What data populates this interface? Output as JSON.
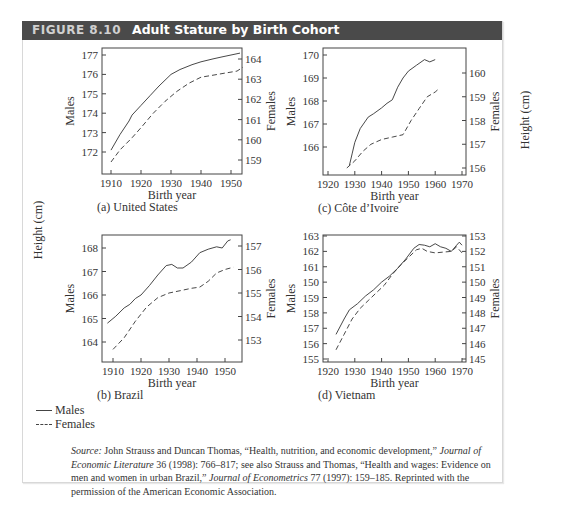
{
  "figure": {
    "number": "FIGURE 8.10",
    "title": "Adult Stature by Birth Cohort",
    "shared_ylabel": "Height (cm)"
  },
  "legend": {
    "items": [
      {
        "label": "Males",
        "style": "solid"
      },
      {
        "label": "Females",
        "style": "dashed"
      }
    ]
  },
  "source": {
    "label": "Source:",
    "text_1": " John Strauss and Duncan Thomas, “Health, nutrition, and economic development,” ",
    "journal_1": "Journal of Economic Literature",
    "text_2": " 36 (1998): 766–817; see also Strauss and Thomas, “Health and wages: Evidence on men and women in urban Brazil,” ",
    "journal_2": "Journal of Econometrics",
    "text_3": " 77 (1997): 159–185. Reprinted with the permission of the American Economic Association."
  },
  "chart_data": [
    {
      "type": "line",
      "panel": "(a) United States",
      "xlabel": "Birth year",
      "ylabel_left": "Males",
      "ylabel_right": "Females",
      "x_ticks": [
        1910,
        1920,
        1930,
        1940,
        1950
      ],
      "y_left_ticks": [
        172,
        173,
        174,
        175,
        176,
        177
      ],
      "y_right_ticks": [
        159,
        160,
        161,
        162,
        163,
        164
      ],
      "frame": {
        "x0": 102,
        "x1": 242,
        "y0": 48,
        "y1": 174
      },
      "xmap": {
        "v0": 1910,
        "p0": 111,
        "v1": 1950,
        "p1": 231
      },
      "ymap_left": {
        "v0": 172,
        "p0": 152,
        "v1": 177,
        "p1": 55
      },
      "ymap_right": {
        "v0": 159,
        "p0": 160,
        "v1": 164,
        "p1": 59
      },
      "series": [
        {
          "name": "Males",
          "axis": "left",
          "style": "solid",
          "x": [
            1910,
            1913,
            1916,
            1917,
            1920,
            1923,
            1926,
            1930,
            1933,
            1937,
            1940,
            1944,
            1947,
            1950,
            1953
          ],
          "y": [
            172.1,
            172.9,
            173.6,
            173.9,
            174.4,
            174.9,
            175.4,
            176.0,
            176.25,
            176.5,
            176.65,
            176.8,
            176.9,
            177.0,
            177.1
          ]
        },
        {
          "name": "Females",
          "axis": "right",
          "style": "dashed",
          "x": [
            1910,
            1913,
            1917,
            1920,
            1924,
            1928,
            1932,
            1936,
            1940,
            1944,
            1948,
            1952,
            1954
          ],
          "y": [
            158.9,
            159.5,
            160.1,
            160.6,
            161.3,
            161.9,
            162.4,
            162.8,
            163.1,
            163.2,
            163.3,
            163.4,
            163.6
          ]
        }
      ]
    },
    {
      "type": "line",
      "panel": "(c) Côte d’Ivoire",
      "xlabel": "Birth year",
      "ylabel_left": "Males",
      "ylabel_right": "Females",
      "x_ticks": [
        1920,
        1930,
        1940,
        1950,
        1960,
        1970
      ],
      "y_left_ticks": [
        166,
        167,
        168,
        169,
        170
      ],
      "y_right_ticks": [
        156,
        157,
        158,
        159,
        160
      ],
      "frame": {
        "x0": 323,
        "x1": 466,
        "y0": 48,
        "y1": 175
      },
      "xmap": {
        "v0": 1920,
        "p0": 328,
        "v1": 1970,
        "p1": 462
      },
      "ymap_left": {
        "v0": 166,
        "p0": 147,
        "v1": 170,
        "p1": 55
      },
      "ymap_right": {
        "v0": 156,
        "p0": 168,
        "v1": 160,
        "p1": 73
      },
      "series": [
        {
          "name": "Males",
          "axis": "left",
          "style": "solid",
          "x": [
            1928,
            1929,
            1930,
            1932,
            1935,
            1937,
            1940,
            1942,
            1944,
            1946,
            1948,
            1950,
            1953,
            1956,
            1958,
            1960
          ],
          "y": [
            165.2,
            165.7,
            166.2,
            166.8,
            167.3,
            167.45,
            167.7,
            167.9,
            168.05,
            168.6,
            169.0,
            169.3,
            169.55,
            169.8,
            169.7,
            169.8
          ]
        },
        {
          "name": "Females",
          "axis": "right",
          "style": "dashed",
          "x": [
            1927,
            1930,
            1933,
            1936,
            1940,
            1944,
            1948,
            1951,
            1954,
            1957,
            1960,
            1961
          ],
          "y": [
            156.0,
            156.3,
            156.7,
            157.0,
            157.2,
            157.3,
            157.4,
            158.0,
            158.5,
            159.0,
            159.2,
            159.3
          ]
        }
      ]
    },
    {
      "type": "line",
      "panel": "(b) Brazil",
      "xlabel": "Birth year",
      "ylabel_left": "Males",
      "ylabel_right": "Females",
      "x_ticks": [
        1910,
        1920,
        1930,
        1940,
        1950
      ],
      "y_left_ticks": [
        164,
        165,
        166,
        167,
        168
      ],
      "y_right_ticks": [
        153,
        154,
        155,
        156,
        157
      ],
      "frame": {
        "x0": 102,
        "x1": 242,
        "y0": 235,
        "y1": 362
      },
      "xmap": {
        "v0": 1910,
        "p0": 113,
        "v1": 1950,
        "p1": 225
      },
      "ymap_left": {
        "v0": 164,
        "p0": 342,
        "v1": 168,
        "p1": 248
      },
      "ymap_right": {
        "v0": 153,
        "p0": 340,
        "v1": 157,
        "p1": 246
      },
      "series": [
        {
          "name": "Males",
          "axis": "left",
          "style": "solid",
          "x": [
            1908,
            1911,
            1914,
            1916,
            1918,
            1920,
            1923,
            1926,
            1929,
            1931,
            1933,
            1935,
            1938,
            1941,
            1944,
            1947,
            1949,
            1951,
            1952
          ],
          "y": [
            164.8,
            165.1,
            165.45,
            165.6,
            165.85,
            166.0,
            166.4,
            166.85,
            167.25,
            167.3,
            167.15,
            167.15,
            167.4,
            167.8,
            167.95,
            168.05,
            168.0,
            168.3,
            168.35
          ]
        },
        {
          "name": "Females",
          "axis": "right",
          "style": "dashed",
          "x": [
            1910,
            1914,
            1918,
            1922,
            1926,
            1930,
            1934,
            1938,
            1941,
            1944,
            1947,
            1950,
            1953
          ],
          "y": [
            152.6,
            153.1,
            153.8,
            154.4,
            154.8,
            155.0,
            155.1,
            155.2,
            155.25,
            155.5,
            155.85,
            156.0,
            156.1
          ]
        }
      ]
    },
    {
      "type": "line",
      "panel": "(d) Vietnam",
      "xlabel": "Birth year",
      "ylabel_left": "Males",
      "ylabel_right": "Females",
      "x_ticks": [
        1920,
        1930,
        1940,
        1950,
        1960,
        1970
      ],
      "y_left_ticks": [
        155,
        156,
        157,
        158,
        159,
        150,
        161,
        162,
        163
      ],
      "y_left_ticks_note": "tick label '150' printed where 160 is expected",
      "y_right_ticks": [
        145,
        146,
        147,
        148,
        149,
        150,
        151,
        152,
        153
      ],
      "frame": {
        "x0": 323,
        "x1": 466,
        "y0": 235,
        "y1": 362
      },
      "xmap": {
        "v0": 1920,
        "p0": 328,
        "v1": 1970,
        "p1": 462
      },
      "ymap_left": {
        "v0": 155,
        "p0": 359,
        "v1": 163,
        "p1": 236
      },
      "ymap_right": {
        "v0": 145,
        "p0": 359,
        "v1": 153,
        "p1": 236
      },
      "series": [
        {
          "name": "Males",
          "axis": "left",
          "style": "solid",
          "x": [
            1923,
            1926,
            1928,
            1931,
            1934,
            1937,
            1940,
            1943,
            1946,
            1949,
            1952,
            1954,
            1956,
            1958,
            1960,
            1962,
            1964,
            1966,
            1968,
            1969,
            1970
          ],
          "y": [
            156.6,
            157.6,
            158.2,
            158.6,
            159.1,
            159.5,
            160.0,
            160.4,
            160.9,
            161.5,
            162.2,
            162.45,
            162.4,
            162.3,
            162.5,
            162.3,
            162.2,
            162.0,
            162.4,
            162.6,
            162.4
          ]
        },
        {
          "name": "Females",
          "axis": "right",
          "style": "dashed",
          "x": [
            1923,
            1926,
            1929,
            1932,
            1935,
            1938,
            1941,
            1944,
            1947,
            1950,
            1953,
            1955,
            1957,
            1960,
            1963,
            1966,
            1968,
            1970
          ],
          "y": [
            145.6,
            146.6,
            147.6,
            148.3,
            148.8,
            149.3,
            149.8,
            150.5,
            151.1,
            151.6,
            152.1,
            152.2,
            152.0,
            151.9,
            151.95,
            152.0,
            152.3,
            151.9
          ]
        }
      ]
    }
  ]
}
